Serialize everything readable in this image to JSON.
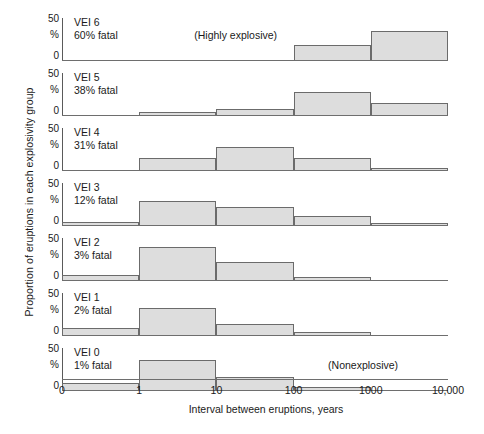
{
  "chart_data": {
    "type": "bar",
    "title": "",
    "xlabel": "Interval between eruptions, years",
    "ylabel": "Proportion of eruptions in each explosivity group",
    "y_unit": "%",
    "x_scale": "log-decades",
    "xlim": [
      0,
      10000
    ],
    "ylim": [
      0,
      50
    ],
    "y_ticks": [
      "50",
      "%",
      "0"
    ],
    "x_ticks": [
      "0",
      "1",
      "10",
      "100",
      "1000",
      "10,000"
    ],
    "x_tick_values": [
      0,
      1,
      10,
      100,
      1000,
      10000
    ],
    "grid": false,
    "legend": "none",
    "bin_edges": [
      "0",
      "1",
      "10",
      "100",
      "1000",
      "10,000"
    ],
    "bins": [
      "0-1",
      "1-10",
      "10-100",
      "100-1000",
      "1000-10,000"
    ],
    "panels": [
      {
        "group": "VEI 6",
        "fatal": "60% fatal",
        "annotation": "(Highly explosive)",
        "annotation_x_pct": 45,
        "values": [
          0,
          0,
          0,
          18,
          35
        ]
      },
      {
        "group": "VEI 5",
        "fatal": "38% fatal",
        "annotation": "",
        "annotation_x_pct": 0,
        "values": [
          0,
          3,
          7,
          27,
          14
        ]
      },
      {
        "group": "VEI 4",
        "fatal": "31% fatal",
        "annotation": "",
        "annotation_x_pct": 0,
        "values": [
          0,
          14,
          27,
          14,
          2
        ]
      },
      {
        "group": "VEI 3",
        "fatal": "12% fatal",
        "annotation": "",
        "annotation_x_pct": 0,
        "values": [
          4,
          28,
          22,
          11,
          2
        ]
      },
      {
        "group": "VEI 2",
        "fatal": "3% fatal",
        "annotation": "",
        "annotation_x_pct": 0,
        "values": [
          6,
          39,
          22,
          3,
          0
        ]
      },
      {
        "group": "VEI 1",
        "fatal": "2% fatal",
        "annotation": "",
        "annotation_x_pct": 0,
        "values": [
          8,
          32,
          13,
          3,
          0
        ]
      },
      {
        "group": "VEI 0",
        "fatal": "1% fatal",
        "annotation": "(Nonexplosive)",
        "annotation_x_pct": 78,
        "values": [
          8,
          36,
          16,
          3,
          0
        ]
      }
    ]
  },
  "style": {
    "bar_fill": "#dddddd",
    "bar_stroke": "#6b6b6b",
    "axis_color": "#6e6e6e",
    "text_color": "#1a1a1a",
    "background": "#ffffff"
  }
}
